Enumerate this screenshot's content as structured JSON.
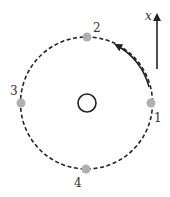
{
  "diagram": {
    "axis": {
      "label": "x",
      "direction": "up"
    },
    "orbit": {
      "style": "dashed",
      "rotation": "counterclockwise"
    },
    "center_object": {
      "shape": "open-circle"
    },
    "points": [
      {
        "id": 1,
        "label": "1",
        "position": "right"
      },
      {
        "id": 2,
        "label": "2",
        "position": "top"
      },
      {
        "id": 3,
        "label": "3",
        "position": "left"
      },
      {
        "id": 4,
        "label": "4",
        "position": "bottom"
      }
    ],
    "colors": {
      "line": "#222222",
      "point": "#b0b0b0",
      "text": "#333333"
    }
  }
}
